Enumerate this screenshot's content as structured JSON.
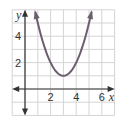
{
  "chart_data": {
    "type": "line",
    "title": "",
    "xlabel": "x",
    "ylabel": "y",
    "xlim": [
      -1,
      7
    ],
    "ylim": [
      -2,
      6
    ],
    "grid": true,
    "x_ticks": [
      2,
      4,
      6
    ],
    "y_ticks": [
      2,
      4
    ],
    "x_tick_labels": [
      "2",
      "4",
      "6"
    ],
    "y_tick_labels": [
      "2",
      "4"
    ],
    "series": [
      {
        "name": "parabola",
        "equation": "y = (x - 3)^2 + 1",
        "vertex": [
          3,
          1
        ],
        "x": [
          0.8,
          1,
          1.5,
          2,
          2.5,
          3,
          3.5,
          4,
          4.5,
          5,
          5.2
        ],
        "y": [
          5.84,
          5,
          3.25,
          2,
          1.25,
          1,
          1.25,
          2,
          3.25,
          5,
          5.84
        ],
        "arrows_both_ends": true,
        "color": "#6b5f6e"
      }
    ],
    "colors": {
      "grid": "#d4d4d4",
      "axis": "#333333",
      "curve": "#6b5f6e"
    }
  }
}
